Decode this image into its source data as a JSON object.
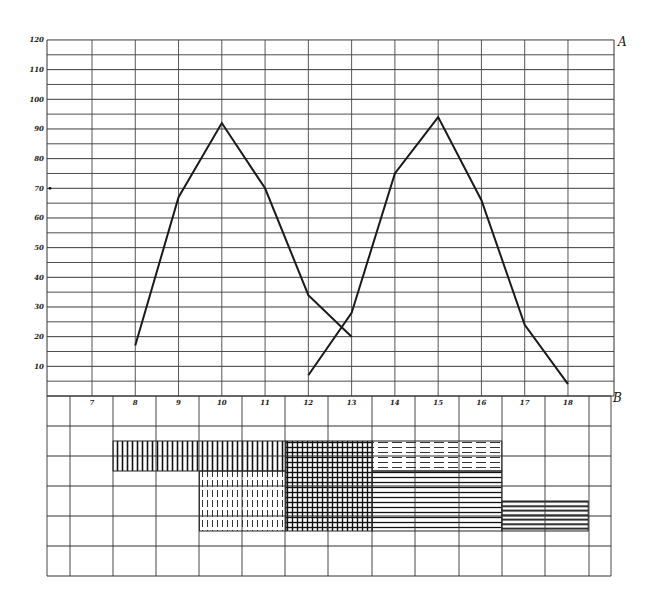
{
  "chart_data": [
    {
      "panel": "A",
      "type": "line",
      "title": "",
      "xlabel": "",
      "ylabel": "",
      "x_ticks": [
        7,
        8,
        9,
        10,
        11,
        12,
        13,
        14,
        15,
        16,
        17,
        18
      ],
      "y_ticks": [
        10,
        20,
        30,
        40,
        50,
        60,
        70,
        80,
        90,
        100,
        110,
        120
      ],
      "ylim": [
        0,
        120
      ],
      "xlim": [
        6.5,
        19
      ],
      "grid": true,
      "series": [
        {
          "name": "curve 1",
          "x": [
            8,
            9,
            10,
            11,
            12,
            13
          ],
          "values": [
            17,
            67,
            92,
            70,
            34,
            20
          ]
        },
        {
          "name": "curve 2",
          "x": [
            12,
            13,
            14,
            15,
            16,
            17,
            18
          ],
          "values": [
            7,
            28,
            75,
            94,
            66,
            24,
            4
          ]
        }
      ],
      "annotations": [
        {
          "text": "A",
          "position": "top-right"
        },
        {
          "text": "•",
          "at_y": 70,
          "position": "left-axis"
        }
      ]
    },
    {
      "panel": "B",
      "type": "table",
      "title": "",
      "description": "Hatched bar blocks on a grid, aligned with x positions 7–18",
      "rows": 6,
      "blocks": [
        {
          "pattern": "vertical-lines",
          "x_start": 8,
          "x_end": 12,
          "row_start": 1.5,
          "row_end": 2.5
        },
        {
          "pattern": "dashed-vertical-lines",
          "x_start": 10,
          "x_end": 12,
          "row_start": 2.5,
          "row_end": 4.5
        },
        {
          "pattern": "cross-hatch",
          "x_start": 12,
          "x_end": 14,
          "row_start": 1.5,
          "row_end": 4.5
        },
        {
          "pattern": "dashed-horizontal-lines",
          "x_start": 14,
          "x_end": 17,
          "row_start": 1.5,
          "row_end": 2.5
        },
        {
          "pattern": "horizontal-lines",
          "x_start": 14,
          "x_end": 17,
          "row_start": 2.5,
          "row_end": 4.5
        },
        {
          "pattern": "horizontal-lines-heavy",
          "x_start": 17,
          "x_end": 19,
          "row_start": 3.5,
          "row_end": 4.5
        }
      ],
      "annotations": [
        {
          "text": "B",
          "position": "top-right"
        }
      ]
    }
  ],
  "labels": {
    "panel_a": "A",
    "panel_b": "B",
    "y_ticks": [
      "120",
      "110",
      "100",
      "90",
      "80",
      "70",
      "60",
      "50",
      "40",
      "30",
      "20",
      "10"
    ],
    "x_ticks": [
      "7",
      "8",
      "9",
      "10",
      "11",
      "12",
      "13",
      "14",
      "15",
      "16",
      "17",
      "18"
    ]
  },
  "colors": {
    "ink": "#1a1a1a",
    "grid": "#333333",
    "paper": "#ffffff"
  }
}
